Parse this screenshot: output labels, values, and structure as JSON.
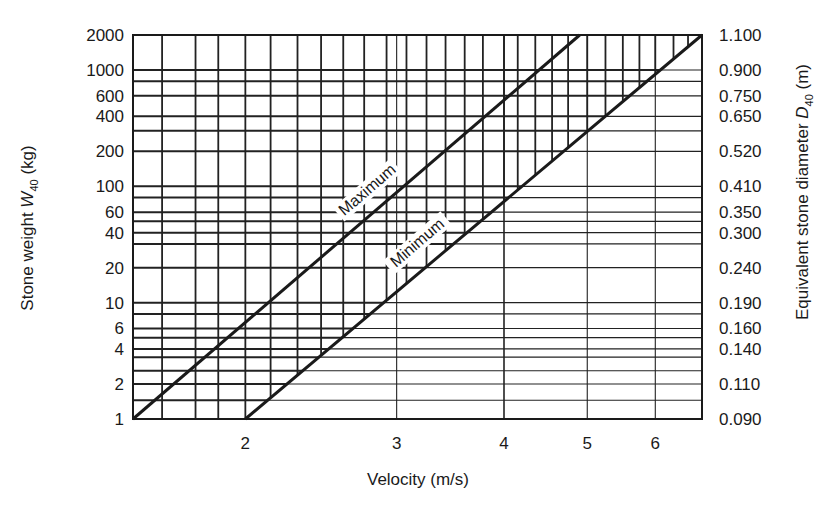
{
  "chart_data": {
    "type": "line",
    "title": "",
    "xlabel": "Velocity (m/s)",
    "ylabel": "Stone weight W40 (kg)",
    "ylabel_parts": {
      "main": "Stone weight ",
      "var": "W",
      "sub": "40",
      "unit": " (kg)"
    },
    "y2label": "Equivalent stone diameter D40 (m)",
    "y2label_parts": {
      "main": "Equivalent stone diameter ",
      "var": "D",
      "sub": "40",
      "unit": " (m)"
    },
    "xscale": "log",
    "yscale": "log",
    "xlim": [
      1.48,
      6.8
    ],
    "ylim": [
      1,
      2000
    ],
    "x_ticks": [
      2,
      3,
      4,
      5,
      6
    ],
    "x_tick_labels": [
      "2",
      "3",
      "4",
      "5",
      "6"
    ],
    "y_ticks": [
      1,
      2,
      4,
      6,
      10,
      20,
      40,
      60,
      100,
      200,
      400,
      600,
      1000,
      2000
    ],
    "y_tick_labels": [
      "1",
      "2",
      "4",
      "6",
      "10",
      "20",
      "40",
      "60",
      "100",
      "200",
      "400",
      "600",
      "1000",
      "2000"
    ],
    "y2_ticks": [
      1,
      2,
      4,
      6,
      10,
      20,
      40,
      60,
      100,
      200,
      400,
      600,
      1000,
      2000
    ],
    "y2_tick_labels": [
      "0.090",
      "0.110",
      "0.140",
      "0.160",
      "0.190",
      "0.240",
      "0.300",
      "0.350",
      "0.410",
      "0.520",
      "0.650",
      "0.750",
      "0.900",
      "1.100"
    ],
    "grid": true,
    "legend": "none (inline line labels)",
    "series": [
      {
        "name": "Maximum",
        "x": [
          1.48,
          4.9
        ],
        "y": [
          1,
          2000
        ],
        "label_at": {
          "x": 3.3,
          "y": 90
        }
      },
      {
        "name": "Minimum",
        "x": [
          2.0,
          6.8
        ],
        "y": [
          1,
          2000
        ],
        "label_at": {
          "x": 3.9,
          "y": 18
        }
      }
    ],
    "shaded_region": "hatched band between Maximum and Minimum lines (acceptable stone weight range)",
    "horizontal_gridlines_kg": [
      1.45,
      2,
      2.6,
      3.4,
      4,
      5,
      6,
      8,
      10,
      20,
      32,
      40,
      50,
      60,
      80,
      100,
      200,
      300,
      400,
      600,
      800,
      1000,
      2000
    ],
    "vertical_gridlines_ms": [
      1.48,
      1.6,
      1.75,
      1.86,
      2.0,
      2.14,
      2.3,
      2.45,
      2.6,
      2.75,
      2.92,
      3.08,
      3.25,
      3.42,
      3.6,
      3.78,
      4.0,
      4.15,
      4.35,
      4.55,
      4.75,
      5.0,
      5.25,
      5.5,
      5.75,
      6.0,
      6.3,
      6.55,
      6.8
    ]
  },
  "plot_box": {
    "left": 133,
    "top": 35,
    "right": 702,
    "bottom": 419
  },
  "colors": {
    "line": "#1a1a1a",
    "grid": "#222222",
    "background": "#ffffff"
  }
}
